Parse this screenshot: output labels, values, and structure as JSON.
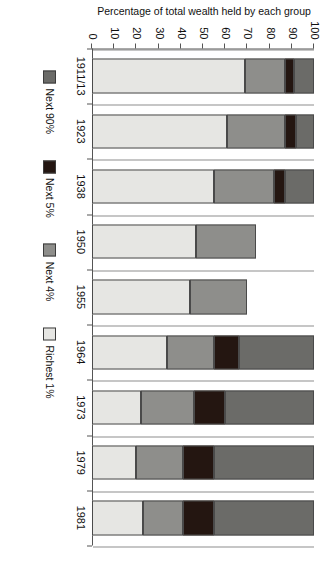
{
  "chart_data": {
    "type": "bar",
    "stacked": true,
    "orientation": "vertical",
    "title": "",
    "xlabel": "",
    "ylabel": "Percentage of total wealth held by each group",
    "ylim": [
      0,
      100
    ],
    "yticks": [
      0,
      10,
      20,
      30,
      40,
      50,
      60,
      70,
      80,
      90,
      100
    ],
    "grid": "vertical-category-separators",
    "legend_position": "bottom",
    "categories": [
      "1911/13",
      "1923",
      "1938",
      "1950",
      "1955",
      "1964",
      "1973",
      "1979",
      "1981"
    ],
    "series": [
      {
        "name": "Richest 1%",
        "color": "#e6e6e3",
        "values": [
          69,
          61,
          55,
          47,
          44,
          34,
          22,
          20,
          23
        ]
      },
      {
        "name": "Next 4%",
        "color": "#8e8e8b",
        "values": [
          18,
          26,
          27,
          27,
          26,
          21,
          24,
          21,
          18
        ]
      },
      {
        "name": "Next 5%",
        "color": "#241611",
        "values": [
          4,
          5,
          5,
          null,
          null,
          11,
          14,
          14,
          14
        ]
      },
      {
        "name": "Next 90%",
        "color": "#6b6b68",
        "values": [
          9,
          8,
          13,
          null,
          null,
          34,
          40,
          45,
          45
        ]
      }
    ]
  },
  "axis": {
    "y_title": "Percentage of total wealth held by each group",
    "tick_labels": [
      "0",
      "10",
      "20",
      "30",
      "40",
      "50",
      "60",
      "70",
      "80",
      "90",
      "100"
    ]
  },
  "legend": {
    "items": [
      {
        "label": "Next 90%",
        "color": "#6b6b68"
      },
      {
        "label": "Next 5%",
        "color": "#241611"
      },
      {
        "label": "Next 4%",
        "color": "#8e8e8b"
      },
      {
        "label": "Richest 1%",
        "color": "#e6e6e3"
      }
    ]
  }
}
